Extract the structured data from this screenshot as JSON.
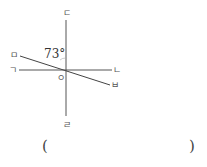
{
  "diagram": {
    "title": "",
    "center_label": "ㅇ",
    "angle_label": "73°",
    "points": {
      "left": "ㄱ",
      "right": "ㄴ",
      "top": "ㄷ",
      "bottom": "ㄹ",
      "upper_left": "ㅁ",
      "lower_right": "ㅂ"
    },
    "lines": [
      {
        "name": "line ㄱㄴ",
        "from": "ㄱ",
        "to": "ㄴ"
      },
      {
        "name": "line ㄷㄹ",
        "from": "ㄷ",
        "to": "ㄹ"
      },
      {
        "name": "line ㅁㅂ",
        "from": "ㅁ",
        "to": "ㅂ"
      }
    ],
    "angle_between": {
      "rays": [
        "ㅇㅁ",
        "ㅇㄷ"
      ],
      "value": "73°"
    }
  },
  "answer": {
    "open_paren": "(",
    "close_paren": ")"
  },
  "colors": {
    "line": "#444444",
    "text": "#555555"
  }
}
